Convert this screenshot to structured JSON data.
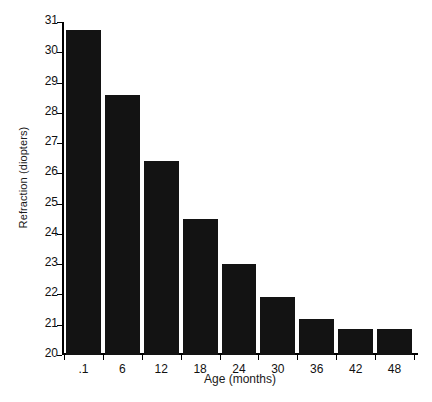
{
  "chart_data": {
    "type": "bar",
    "title": "",
    "subtitle": "",
    "xlabel": "Age (months)",
    "ylabel": "Refraction (diopters)",
    "categories": [
      ".1",
      "6",
      "12",
      "18",
      "24",
      "30",
      "36",
      "42",
      "48"
    ],
    "values": [
      30.75,
      28.6,
      26.4,
      24.5,
      23.0,
      21.9,
      21.2,
      20.85,
      20.85
    ],
    "ylim": [
      20,
      31
    ],
    "ytick_labels": [
      "20",
      "21",
      "22",
      "23",
      "24",
      "25",
      "26",
      "27",
      "28",
      "29",
      "30",
      "31"
    ],
    "ytick_values": [
      20,
      21,
      22,
      23,
      24,
      25,
      26,
      27,
      28,
      29,
      30,
      31
    ],
    "xlim_note": "categorical",
    "grid": false,
    "legend": false,
    "bar_color": "#131313",
    "axis_color": "#000000",
    "background": "#ffffff"
  }
}
